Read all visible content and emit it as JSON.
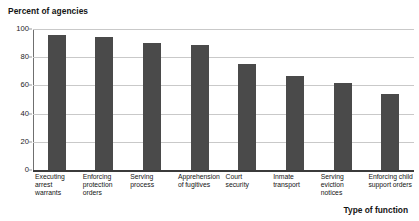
{
  "chart_data": {
    "type": "bar",
    "title": "",
    "ylabel": "Percent of agencies",
    "xlabel": "Type of function",
    "ylim": [
      0,
      100
    ],
    "yticks": [
      0,
      20,
      40,
      60,
      80,
      100
    ],
    "ytick_labels": [
      "0",
      "20",
      "40",
      "60",
      "80",
      "100"
    ],
    "grid": true,
    "legend": "none",
    "categories": [
      "Executing arrest warrants",
      "Enforcing protection orders",
      "Serving process",
      "Apprehension of fugitives",
      "Court security",
      "Inmate transport",
      "Serving eviction notices",
      "Enforcing child support orders"
    ],
    "category_lines": [
      [
        "Executing",
        "arrest",
        "warrants"
      ],
      [
        "Enforcing",
        "protection",
        "orders"
      ],
      [
        "Serving",
        "process"
      ],
      [
        "Apprehension",
        "of fugitives"
      ],
      [
        "Court",
        "security"
      ],
      [
        "Inmate",
        "transport"
      ],
      [
        "Serving",
        "eviction",
        "notices"
      ],
      [
        "Enforcing child",
        "support orders"
      ]
    ],
    "values": [
      96,
      94,
      90,
      89,
      75,
      67,
      62,
      54
    ],
    "bar_color": "#4a4a4a",
    "gridline_color": "#c9c9c9",
    "axis_color": "#3b3b3b",
    "background_color": "#ffffff"
  }
}
